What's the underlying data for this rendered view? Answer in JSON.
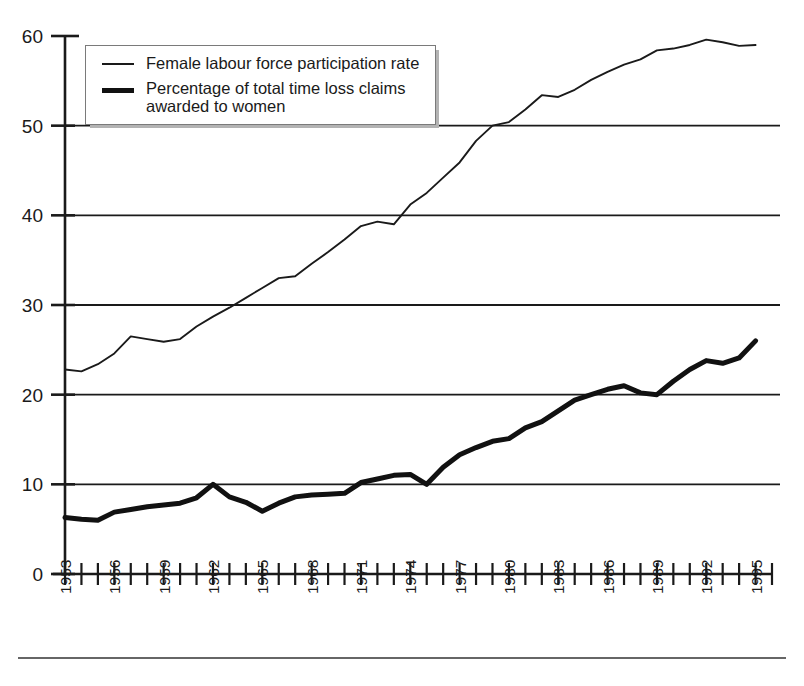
{
  "chart_data": {
    "type": "line",
    "title": "",
    "xlabel": "",
    "ylabel": "",
    "xlim": [
      1953,
      1996
    ],
    "ylim": [
      0,
      60
    ],
    "yticks": [
      0,
      10,
      20,
      30,
      40,
      50,
      60
    ],
    "ytick_labels": [
      "0",
      "10",
      "20",
      "30",
      "40",
      "50",
      "60"
    ],
    "gridlines": [
      10,
      20,
      30,
      40,
      50
    ],
    "grid": "horizontal-only",
    "legend_position": "top-left-inside",
    "x": [
      1953,
      1954,
      1955,
      1956,
      1957,
      1958,
      1959,
      1960,
      1961,
      1962,
      1963,
      1964,
      1965,
      1966,
      1967,
      1968,
      1969,
      1970,
      1971,
      1972,
      1973,
      1974,
      1975,
      1976,
      1977,
      1978,
      1979,
      1980,
      1981,
      1982,
      1983,
      1984,
      1985,
      1986,
      1987,
      1988,
      1989,
      1990,
      1991,
      1992,
      1993,
      1994,
      1995
    ],
    "xtick_labels": [
      "1953",
      "1956",
      "1959",
      "1962",
      "1965",
      "1968",
      "1971",
      "1974",
      "1977",
      "1980",
      "1983",
      "1986",
      "1989",
      "1992",
      "1995"
    ],
    "xtick_years": [
      1953,
      1956,
      1959,
      1962,
      1965,
      1968,
      1971,
      1974,
      1977,
      1980,
      1983,
      1986,
      1989,
      1992,
      1995
    ],
    "series": [
      {
        "name": "Female labour force participation rate",
        "style": "thin",
        "color": "#1a1a1a",
        "values": [
          22.8,
          22.6,
          23.4,
          24.6,
          26.5,
          26.2,
          25.9,
          26.2,
          27.6,
          28.7,
          29.7,
          30.8,
          31.9,
          33.0,
          33.2,
          34.6,
          35.9,
          37.3,
          38.8,
          39.3,
          39.0,
          41.2,
          42.5,
          44.2,
          45.9,
          48.3,
          50.0,
          50.4,
          51.8,
          53.4,
          53.2,
          54.0,
          55.1,
          56.0,
          56.8,
          57.4,
          58.4,
          58.6,
          59.0,
          59.6,
          59.3,
          58.9,
          59.0
        ]
      },
      {
        "name": "Percentage of total time loss claims awarded to women",
        "style": "thick",
        "color": "#111111",
        "values": [
          6.3,
          6.1,
          6.0,
          6.9,
          7.2,
          7.5,
          7.7,
          7.9,
          8.5,
          10.0,
          8.6,
          8.0,
          7.0,
          7.9,
          8.6,
          8.8,
          8.9,
          9.0,
          10.2,
          10.6,
          11.0,
          11.1,
          10.0,
          11.9,
          13.3,
          14.1,
          14.8,
          15.1,
          16.3,
          17.0,
          18.2,
          19.4,
          20.0,
          20.6,
          21.0,
          20.2,
          20.0,
          21.5,
          22.8,
          23.8,
          23.5,
          24.1,
          26.0
        ]
      }
    ]
  },
  "legend": {
    "items": [
      {
        "label": "Female labour force participation rate",
        "style": "thin"
      },
      {
        "label": "Percentage of total time loss claims\nawarded to women",
        "style": "thick"
      }
    ]
  },
  "colors": {
    "axis": "#1a1a1a",
    "grid": "#1a1a1a",
    "thin_series": "#1a1a1a",
    "thick_series": "#111111",
    "legend_shadow": "#b3b3b3",
    "legend_border": "#7a7a7a",
    "footer_rule": "#666666",
    "background": "#ffffff"
  }
}
